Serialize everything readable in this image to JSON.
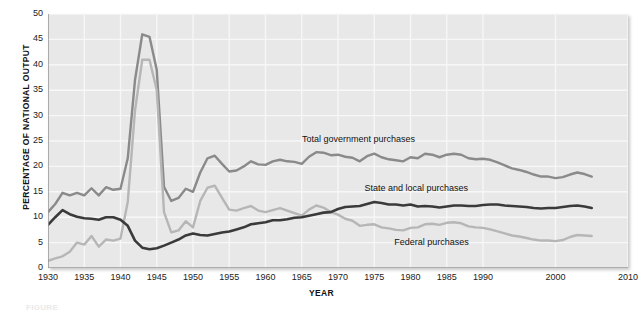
{
  "figure": {
    "caption": "FIGURE",
    "xlabel": "YEAR",
    "ylabel": "PERCENTAGE OF NATIONAL OUTPUT"
  },
  "annotations": {
    "total": "Total government purchases",
    "state_local": "State and local purchases",
    "federal": "Federal purchases"
  },
  "colors": {
    "plot_background": "#e8e8e8",
    "gridline": "#f7f7f7",
    "total": "#8a8a8a",
    "state_local": "#b6b6b6",
    "federal": "#3a3a3a",
    "axis": "#9a9a9a",
    "text": "#1a1a1a"
  },
  "chart_data": {
    "type": "line",
    "title": "",
    "xlabel": "YEAR",
    "ylabel": "PERCENTAGE OF NATIONAL OUTPUT",
    "xlim": [
      1930,
      2010
    ],
    "ylim": [
      0,
      50
    ],
    "grid": true,
    "legend_position": "inline-annotations",
    "xticks": [
      1930,
      1935,
      1940,
      1945,
      1950,
      1955,
      1960,
      1965,
      1970,
      1975,
      1980,
      1985,
      1990,
      2000,
      2010
    ],
    "yticks": [
      0,
      5,
      10,
      15,
      20,
      25,
      30,
      35,
      40,
      45,
      50
    ],
    "x": [
      1930,
      1931,
      1932,
      1933,
      1934,
      1935,
      1936,
      1937,
      1938,
      1939,
      1940,
      1941,
      1942,
      1943,
      1944,
      1945,
      1946,
      1947,
      1948,
      1949,
      1950,
      1951,
      1952,
      1953,
      1954,
      1955,
      1956,
      1957,
      1958,
      1959,
      1960,
      1961,
      1962,
      1963,
      1964,
      1965,
      1966,
      1967,
      1968,
      1969,
      1970,
      1971,
      1972,
      1973,
      1974,
      1975,
      1976,
      1977,
      1978,
      1979,
      1980,
      1981,
      1982,
      1983,
      1984,
      1985,
      1986,
      1987,
      1988,
      1989,
      1990,
      1991,
      1992,
      1993,
      1994,
      1995,
      1996,
      1997,
      1998,
      1999,
      2000,
      2001,
      2002,
      2003,
      2004,
      2005
    ],
    "series": [
      {
        "name": "Total government purchases",
        "color": "#8a8a8a",
        "values": [
          11.0,
          12.6,
          14.8,
          14.3,
          14.8,
          14.3,
          15.7,
          14.3,
          15.9,
          15.4,
          15.6,
          21.6,
          37.0,
          46.0,
          45.5,
          39.0,
          16.0,
          13.2,
          13.8,
          15.6,
          15.0,
          18.8,
          21.6,
          22.1,
          20.5,
          19.0,
          19.2,
          20.0,
          21.0,
          20.4,
          20.3,
          21.0,
          21.3,
          21.0,
          20.9,
          20.5,
          21.9,
          22.8,
          22.7,
          22.2,
          22.3,
          21.9,
          21.7,
          21.0,
          22.0,
          22.5,
          21.8,
          21.4,
          21.2,
          21.0,
          21.8,
          21.6,
          22.5,
          22.3,
          21.8,
          22.3,
          22.5,
          22.3,
          21.6,
          21.4,
          21.5,
          21.3,
          20.8,
          20.2,
          19.6,
          19.3,
          18.9,
          18.4,
          18.0,
          18.0,
          17.7,
          17.9,
          18.4,
          18.8,
          18.5,
          18.0
        ]
      },
      {
        "name": "Federal purchases",
        "color": "#b6b6b6",
        "values": [
          1.4,
          1.9,
          2.3,
          3.2,
          5.0,
          4.6,
          6.3,
          4.2,
          5.6,
          5.4,
          5.8,
          13.0,
          31.0,
          41.0,
          41.0,
          35.0,
          11.0,
          7.0,
          7.4,
          9.2,
          8.0,
          13.2,
          15.8,
          16.2,
          13.8,
          11.5,
          11.3,
          11.8,
          12.2,
          11.3,
          11.0,
          11.4,
          11.8,
          11.3,
          10.8,
          10.3,
          11.5,
          12.3,
          11.9,
          11.0,
          10.5,
          9.7,
          9.3,
          8.3,
          8.5,
          8.6,
          8.0,
          7.8,
          7.5,
          7.4,
          7.9,
          8.0,
          8.6,
          8.7,
          8.5,
          8.9,
          9.0,
          8.8,
          8.2,
          8.0,
          7.9,
          7.6,
          7.2,
          6.8,
          6.4,
          6.2,
          5.9,
          5.6,
          5.4,
          5.4,
          5.3,
          5.5,
          6.1,
          6.5,
          6.4,
          6.3
        ]
      },
      {
        "name": "State and local purchases",
        "color": "#3a3a3a",
        "values": [
          8.5,
          10.0,
          11.4,
          10.6,
          10.1,
          9.8,
          9.7,
          9.5,
          10.0,
          10.0,
          9.5,
          8.3,
          5.4,
          4.0,
          3.7,
          3.9,
          4.4,
          5.0,
          5.6,
          6.4,
          6.8,
          6.5,
          6.4,
          6.7,
          7.0,
          7.2,
          7.6,
          8.0,
          8.6,
          8.8,
          9.0,
          9.4,
          9.4,
          9.6,
          9.9,
          10.0,
          10.3,
          10.6,
          10.9,
          11.0,
          11.6,
          12.0,
          12.1,
          12.2,
          12.6,
          13.0,
          12.8,
          12.5,
          12.5,
          12.3,
          12.5,
          12.1,
          12.2,
          12.1,
          11.9,
          12.1,
          12.3,
          12.3,
          12.2,
          12.2,
          12.4,
          12.5,
          12.5,
          12.3,
          12.2,
          12.1,
          12.0,
          11.8,
          11.7,
          11.8,
          11.8,
          12.0,
          12.2,
          12.3,
          12.1,
          11.8
        ]
      }
    ]
  }
}
